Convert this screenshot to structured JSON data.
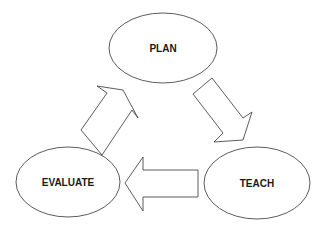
{
  "diagram": {
    "type": "cycle",
    "nodes": [
      {
        "id": "plan",
        "label": "PLAN",
        "cx": 163,
        "cy": 48,
        "rx": 54,
        "ry": 35
      },
      {
        "id": "teach",
        "label": "TEACH",
        "cx": 257,
        "cy": 183,
        "rx": 53,
        "ry": 36
      },
      {
        "id": "evaluate",
        "label": "EVALUATE",
        "cx": 68,
        "cy": 182,
        "rx": 52,
        "ry": 35
      }
    ],
    "edges": [
      {
        "from": "plan",
        "to": "teach",
        "direction": "down-right"
      },
      {
        "from": "teach",
        "to": "evaluate",
        "direction": "left"
      },
      {
        "from": "evaluate",
        "to": "plan",
        "direction": "up-right"
      }
    ],
    "colors": {
      "stroke": "#4a4a4a",
      "fill": "#ffffff",
      "text": "#1a1a1a"
    }
  }
}
